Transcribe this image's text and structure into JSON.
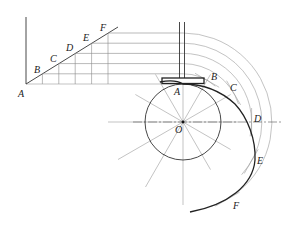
{
  "diagram": {
    "displacement_labels": [
      "A",
      "B",
      "C",
      "D",
      "E",
      "F"
    ],
    "profile_labels": [
      "A",
      "B",
      "C",
      "D",
      "E",
      "F"
    ],
    "center_label": "O",
    "radial_divisions": 12,
    "displacement_steps": 5,
    "colors": {
      "line": "#222222",
      "construction": "#9a9a9a"
    }
  }
}
